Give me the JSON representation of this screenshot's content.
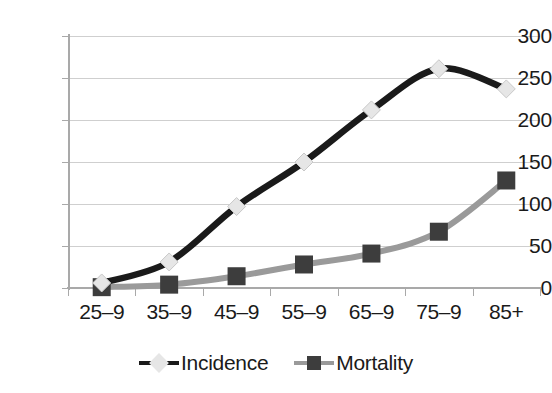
{
  "chart_data": {
    "type": "line",
    "title": "",
    "subtitle": "",
    "xlabel": "",
    "ylabel": "",
    "categories": [
      "25–9",
      "35–9",
      "45–9",
      "55–9",
      "65–9",
      "75–9",
      "85+"
    ],
    "ylim": [
      0,
      300
    ],
    "ytick_values": [
      0,
      50,
      100,
      150,
      200,
      250,
      300
    ],
    "ytick_labels": [
      "0",
      "50",
      "100",
      "150",
      "200",
      "250",
      "300"
    ],
    "grid": true,
    "legend_position": "bottom-center",
    "series": [
      {
        "name": "Incidence",
        "color": "#1a1a1a",
        "marker": "diamond",
        "marker_color": "#e6e6e6",
        "values": [
          6,
          31,
          97,
          150,
          212,
          261,
          237
        ]
      },
      {
        "name": "Mortality",
        "color": "#9a9a9a",
        "marker": "square",
        "marker_color": "#3d3d3d",
        "values": [
          1,
          4,
          14,
          28,
          41,
          67,
          128
        ]
      }
    ]
  },
  "legend": {
    "items": [
      {
        "label": "Incidence",
        "line_color": "#1a1a1a",
        "marker_color": "#e6e6e6",
        "marker": "diamond"
      },
      {
        "label": "Mortality",
        "line_color": "#9a9a9a",
        "marker_color": "#3d3d3d",
        "marker": "square"
      }
    ]
  },
  "colors": {
    "incidence_line": "#1a1a1a",
    "incidence_marker": "#e6e6e6",
    "mortality_line": "#9a9a9a",
    "mortality_marker": "#3d3d3d",
    "gridline": "#cfcfcf",
    "axis": "#a9a9a9",
    "text": "#1a1a1a",
    "background": "#ffffff"
  }
}
